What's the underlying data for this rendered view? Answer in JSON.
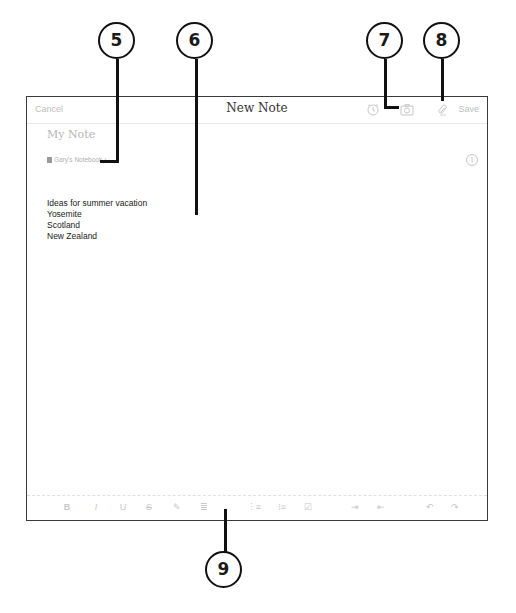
{
  "navbar": {
    "cancel_label": "Cancel",
    "title": "New Note",
    "save_label": "Save",
    "icons": [
      "alarm-clock-icon",
      "camera-icon",
      "attachment-icon"
    ]
  },
  "note": {
    "title_placeholder": "My Note",
    "notebook_label": "Gary's Notebook",
    "notebook_chevron": "›",
    "info_icon": "i",
    "body_lines": [
      "Ideas for summer vacation",
      "Yosemite",
      "Scotland",
      "New Zealand"
    ]
  },
  "toolbar": {
    "buttons": [
      {
        "name": "bold",
        "glyph": "B"
      },
      {
        "name": "italic",
        "glyph": "I"
      },
      {
        "name": "underline",
        "glyph": "U"
      },
      {
        "name": "strikethrough",
        "glyph": "S"
      },
      {
        "name": "highlight",
        "glyph": "✎"
      },
      {
        "name": "align",
        "glyph": "≣"
      },
      {
        "name": "numbered-list",
        "glyph": "⋮≡"
      },
      {
        "name": "bulleted-list",
        "glyph": "⁝≡"
      },
      {
        "name": "checkbox",
        "glyph": "☑"
      },
      {
        "name": "indent",
        "glyph": "⇥"
      },
      {
        "name": "outdent",
        "glyph": "⇤"
      },
      {
        "name": "undo",
        "glyph": "↶"
      },
      {
        "name": "redo",
        "glyph": "↷"
      }
    ]
  },
  "callouts": [
    "5",
    "6",
    "7",
    "8",
    "9"
  ]
}
